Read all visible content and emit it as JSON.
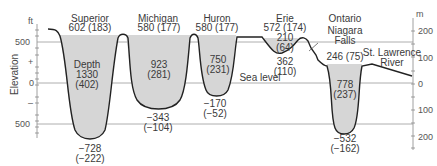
{
  "diagram": {
    "type": "cross-section profile",
    "left_axis": {
      "unit": "ft",
      "title": "Elevation",
      "ticks": [
        "500",
        "+",
        "0",
        "–",
        "500"
      ]
    },
    "right_axis": {
      "unit": "m",
      "ticks": [
        "200",
        "100",
        "0",
        "100",
        "200"
      ]
    },
    "reference_line": "Sea level",
    "lakes": [
      {
        "name": "Superior",
        "surface": "602 (183)",
        "depth_label": "Depth",
        "depth": "1330",
        "depth_m": "(402)",
        "bottom": "−728",
        "bottom_m": "(−222)"
      },
      {
        "name": "Michigan",
        "surface": "580 (177)",
        "depth": "923",
        "depth_m": "(281)",
        "bottom": "−343",
        "bottom_m": "(−104)"
      },
      {
        "name": "Huron",
        "surface": "580 (177)",
        "depth": "750",
        "depth_m": "(231)",
        "bottom": "−170",
        "bottom_m": "(−52)"
      },
      {
        "name": "Erie",
        "surface": "572 (174)",
        "depth": "210",
        "depth_m": "(64)",
        "bottom": "362",
        "bottom_m": "(110)"
      },
      {
        "name": "Ontario",
        "surface": "246 (75)",
        "depth": "778",
        "depth_m": "(237)",
        "bottom": "−532",
        "bottom_m": "(−162)"
      }
    ],
    "features": {
      "falls": [
        "Niagara",
        "Falls"
      ],
      "river": [
        "St. Lawrence",
        "River"
      ]
    }
  }
}
